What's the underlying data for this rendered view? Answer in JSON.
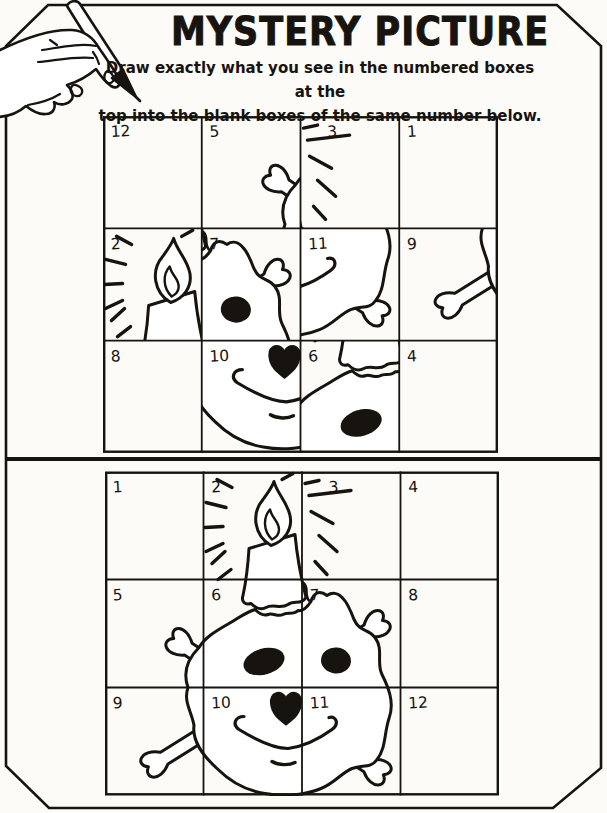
{
  "page": {
    "title": "MYSTERY PICTURE",
    "instructions": {
      "line1": "Draw exactly what you see in the numbered boxes at the",
      "line2": "top into the blank boxes of the same number below."
    },
    "ink_color": "#17130f",
    "paper_color": "#fcfbf8"
  },
  "top_grid": {
    "label": "scrambled picture pieces grid",
    "rows": 3,
    "cols": 4,
    "cell_numbers": [
      [
        12,
        5,
        3,
        1
      ],
      [
        2,
        7,
        11,
        9
      ],
      [
        8,
        10,
        6,
        4
      ]
    ]
  },
  "bottom_grid": {
    "label": "answer grid with complete picture",
    "rows": 3,
    "cols": 4,
    "cell_numbers": [
      [
        1,
        2,
        3,
        4
      ],
      [
        5,
        6,
        7,
        8
      ],
      [
        9,
        10,
        11,
        12
      ]
    ]
  },
  "artwork_description": "skull and crossbones with a lit melting candle on top"
}
